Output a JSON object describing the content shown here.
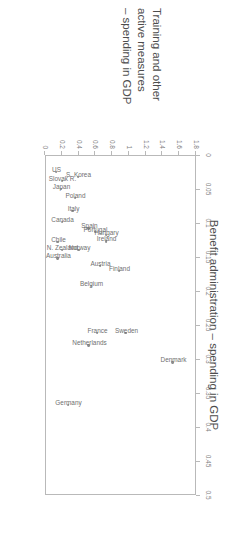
{
  "chart_data": {
    "type": "scatter",
    "title": "",
    "xlabel": "Benefit administration – spending in GDP",
    "ylabel_lines": [
      "Training and other",
      "active measures",
      "– spending in GDP"
    ],
    "ylabel": "Training and other active measures – spending in GDP",
    "xlim": [
      0,
      0.5
    ],
    "ylim": [
      0,
      1.8
    ],
    "xticks": [
      "0",
      "0.05",
      "0.1",
      "0.15",
      "0.2",
      "0.25",
      "0.3",
      "0.35",
      "0.4",
      "0.45",
      "0.5"
    ],
    "xtick_values": [
      0,
      0.05,
      0.1,
      0.15,
      0.2,
      0.25,
      0.3,
      0.35,
      0.4,
      0.45,
      0.5
    ],
    "yticks": [
      "0",
      "0.2",
      "0.4",
      "0.6",
      "0.8",
      "1",
      "1.2",
      "1.4",
      "1.6",
      "1.8"
    ],
    "ytick_values": [
      0,
      0.2,
      0.4,
      0.6,
      0.8,
      1.0,
      1.2,
      1.4,
      1.6,
      1.8
    ],
    "grid": false,
    "legend": false,
    "marker_color": "#8d8d8d",
    "axis_color": "#b9b9b9",
    "text_color": "#6f6f6f",
    "points": [
      {
        "label": "US",
        "x": 0.025,
        "y": 0.13
      },
      {
        "label": "Japan",
        "x": 0.05,
        "y": 0.19
      },
      {
        "label": "S. Korea",
        "x": 0.032,
        "y": 0.39
      },
      {
        "label": "Slovak R.",
        "x": 0.038,
        "y": 0.2
      },
      {
        "label": "Poland",
        "x": 0.063,
        "y": 0.36
      },
      {
        "label": "Italy",
        "x": 0.082,
        "y": 0.33
      },
      {
        "label": "Canada",
        "x": 0.098,
        "y": 0.2
      },
      {
        "label": "Spain",
        "x": 0.108,
        "y": 0.52
      },
      {
        "label": "Chile",
        "x": 0.128,
        "y": 0.15
      },
      {
        "label": "Portugal",
        "x": 0.113,
        "y": 0.6
      },
      {
        "label": "Hungary",
        "x": 0.118,
        "y": 0.73
      },
      {
        "label": "Ireland",
        "x": 0.127,
        "y": 0.73
      },
      {
        "label": "N. Zealand",
        "x": 0.14,
        "y": 0.2
      },
      {
        "label": "Norway",
        "x": 0.14,
        "y": 0.4
      },
      {
        "label": "Australia",
        "x": 0.152,
        "y": 0.15
      },
      {
        "label": "Austria",
        "x": 0.163,
        "y": 0.66
      },
      {
        "label": "Finland",
        "x": 0.17,
        "y": 0.88
      },
      {
        "label": "Belgium",
        "x": 0.192,
        "y": 0.55
      },
      {
        "label": "Sweden",
        "x": 0.262,
        "y": 0.96
      },
      {
        "label": "France",
        "x": 0.262,
        "y": 0.62
      },
      {
        "label": "Netherlands",
        "x": 0.28,
        "y": 0.52
      },
      {
        "label": "Denmark",
        "x": 0.305,
        "y": 1.52
      },
      {
        "label": "Germany",
        "x": 0.368,
        "y": 0.28
      }
    ]
  }
}
